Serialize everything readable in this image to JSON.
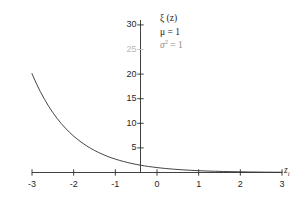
{
  "chart_data": {
    "type": "line",
    "title": "",
    "xlabel": "z_i",
    "ylabel": "",
    "xlim": [
      -3,
      3
    ],
    "ylim": [
      0,
      31
    ],
    "grid": false,
    "legend_position": "top-right",
    "x_ticks": [
      {
        "value": -3,
        "label": "-3"
      },
      {
        "value": -2,
        "label": "-2"
      },
      {
        "value": -1,
        "label": "-1"
      },
      {
        "value": 0,
        "label": "0"
      },
      {
        "value": 1,
        "label": "1"
      },
      {
        "value": 2,
        "label": "2"
      },
      {
        "value": 3,
        "label": "3"
      }
    ],
    "y_ticks": [
      {
        "value": 30,
        "label": "30",
        "faded": false
      },
      {
        "value": 25,
        "label": "25",
        "faded": true
      },
      {
        "value": 20,
        "label": "20",
        "faded": false
      },
      {
        "value": 15,
        "label": "15",
        "faded": false
      },
      {
        "value": 10,
        "label": "10",
        "faded": false
      },
      {
        "value": 5,
        "label": "5",
        "faded": false
      }
    ],
    "series": [
      {
        "name": "xi(z)",
        "color": "#3a3a3a",
        "x": [
          -3.0,
          -2.9,
          -2.8,
          -2.7,
          -2.6,
          -2.5,
          -2.4,
          -2.3,
          -2.2,
          -2.1,
          -2.0,
          -1.9,
          -1.8,
          -1.7,
          -1.6,
          -1.5,
          -1.4,
          -1.3,
          -1.2,
          -1.1,
          -1.0,
          -0.9,
          -0.8,
          -0.7,
          -0.6,
          -0.5,
          -0.4,
          -0.3,
          -0.2,
          -0.1,
          0.0,
          0.2,
          0.4,
          0.6,
          0.8,
          1.0,
          1.2,
          1.4,
          1.6,
          1.8,
          2.0,
          2.2,
          2.4,
          2.6,
          2.8,
          3.0
        ],
        "y": [
          20.09,
          18.17,
          16.44,
          14.88,
          13.46,
          12.18,
          11.02,
          9.97,
          9.03,
          8.17,
          7.39,
          6.69,
          6.05,
          5.47,
          4.95,
          4.48,
          4.06,
          3.67,
          3.32,
          3.0,
          2.72,
          2.46,
          2.23,
          2.01,
          1.82,
          1.65,
          1.49,
          1.35,
          1.22,
          1.11,
          1.0,
          0.82,
          0.67,
          0.55,
          0.45,
          0.37,
          0.3,
          0.25,
          0.2,
          0.17,
          0.14,
          0.11,
          0.09,
          0.07,
          0.06,
          0.05
        ]
      }
    ],
    "annotations": [
      {
        "id": "function-label",
        "text": "ξ (z)",
        "faded": false
      },
      {
        "id": "mu-label",
        "text": "μ = 1",
        "faded": false
      },
      {
        "id": "sigma-label",
        "text": "σ² = 1",
        "faded": true
      }
    ],
    "axis_label_x": "z",
    "axis_label_x_sub": "i"
  },
  "legend": {
    "line1": "ξ (z)",
    "line2": "μ = 1",
    "line3_symbol": "σ",
    "line3_sup": "2",
    "line3_rest": " = 1"
  }
}
